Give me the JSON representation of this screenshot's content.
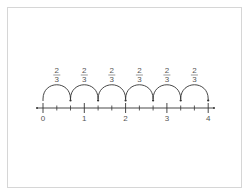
{
  "diagram": {
    "type": "number-line-jumps",
    "number_line": {
      "min": 0,
      "max": 4,
      "subdivision": 3,
      "labels": [
        "0",
        "1",
        "2",
        "3",
        "4"
      ]
    },
    "jumps": [
      {
        "from": "0",
        "to": "2/3",
        "numerator": "2",
        "denominator": "3"
      },
      {
        "from": "2/3",
        "to": "4/3",
        "numerator": "2",
        "denominator": "3"
      },
      {
        "from": "4/3",
        "to": "2",
        "numerator": "2",
        "denominator": "3"
      },
      {
        "from": "2",
        "to": "8/3",
        "numerator": "2",
        "denominator": "3"
      },
      {
        "from": "8/3",
        "to": "10/3",
        "numerator": "2",
        "denominator": "3"
      },
      {
        "from": "10/3",
        "to": "4",
        "numerator": "2",
        "denominator": "3"
      }
    ],
    "colors": {
      "line": "#333333",
      "text": "#555555",
      "frame": "#d6d6d6"
    }
  }
}
